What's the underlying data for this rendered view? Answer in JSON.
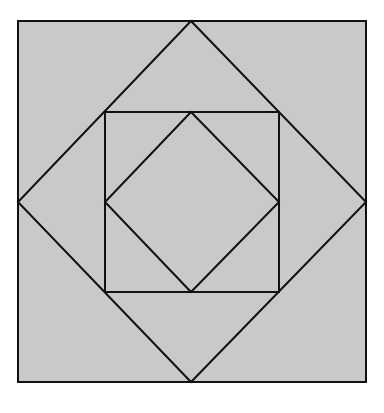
{
  "diagram": {
    "colors": {
      "background": "#ffffff",
      "fill": "#c9c9c9",
      "stroke": "#111111"
    },
    "stroke_width": 2,
    "shapes": [
      {
        "name": "outer-square",
        "points": [
          [
            18,
            21
          ],
          [
            366,
            21
          ],
          [
            366,
            382
          ],
          [
            18,
            382
          ]
        ]
      },
      {
        "name": "outer-diamond",
        "points": [
          [
            191,
            21
          ],
          [
            366,
            202
          ],
          [
            191,
            382
          ],
          [
            18,
            202
          ]
        ]
      },
      {
        "name": "middle-square",
        "points": [
          [
            105,
            112
          ],
          [
            279,
            112
          ],
          [
            279,
            292
          ],
          [
            105,
            292
          ]
        ]
      },
      {
        "name": "inner-diamond",
        "points": [
          [
            191,
            112
          ],
          [
            279,
            202
          ],
          [
            191,
            292
          ],
          [
            105,
            202
          ]
        ]
      }
    ]
  }
}
